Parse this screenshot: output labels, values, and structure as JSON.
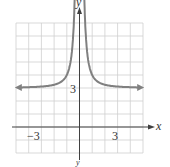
{
  "chart_data": {
    "type": "line",
    "title": "",
    "function": "y = 1/x^2 + 3",
    "xlabel": "x",
    "ylabel": "y",
    "xlim": [
      -5,
      5
    ],
    "ylim": [
      -2,
      8
    ],
    "grid": true,
    "tick_labels": {
      "x": [
        "-3",
        "3"
      ],
      "y": [
        "3"
      ]
    },
    "asymptotes": {
      "vertical": 0,
      "horizontal": 3
    },
    "series": [
      {
        "name": "left branch",
        "x": [
          -5,
          -3,
          -2,
          -1,
          -0.6,
          -0.4
        ],
        "y": [
          3.04,
          3.11,
          3.25,
          4,
          5.78,
          9.25
        ]
      },
      {
        "name": "right branch",
        "x": [
          0.4,
          0.6,
          1,
          2,
          3,
          5
        ],
        "y": [
          9.25,
          5.78,
          4,
          3.25,
          3.11,
          3.04
        ]
      }
    ],
    "colors": {
      "curve": "#808080",
      "grid": "#c8c8c8",
      "axis": "#404040"
    }
  },
  "labels": {
    "x_axis": "x",
    "y_axis": "y",
    "x_neg": "−3",
    "x_pos": "3",
    "y_three": "3",
    "bottom": "y"
  }
}
